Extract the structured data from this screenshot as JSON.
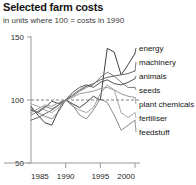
{
  "header": {
    "title": "Selected farm costs",
    "subtitle": "in units where 100 = costs in 1990"
  },
  "chart_data": {
    "type": "line",
    "title": "Selected farm costs",
    "subtitle": "in units where 100 = costs in 1990",
    "xlabel": "",
    "ylabel": "",
    "xlim": [
      1985,
      2000
    ],
    "ylim": [
      50,
      150
    ],
    "yticks": [
      50,
      100,
      150
    ],
    "ytick_labels": [
      "50",
      "100",
      "150"
    ],
    "xticks": [
      1985,
      1990,
      1995,
      2000
    ],
    "xtick_labels": [
      "1985",
      "1990",
      "1995",
      "2000"
    ],
    "grid": false,
    "reference_line": {
      "value": 100,
      "style": "dashed",
      "color": "#808080"
    },
    "legend_position": "right-inline",
    "x": [
      1985,
      1986,
      1987,
      1988,
      1989,
      1990,
      1991,
      1992,
      1993,
      1994,
      1995,
      1996,
      1997,
      1998,
      1999,
      2000
    ],
    "series": [
      {
        "name": "energy",
        "color": "#2b2b2b",
        "label_y": 48,
        "values": [
          95,
          88,
          82,
          80,
          92,
          100,
          97,
          94,
          98,
          103,
          100,
          141,
          138,
          120,
          128,
          137
        ]
      },
      {
        "name": "machinery",
        "color": "#555555",
        "label_y": 62,
        "values": [
          84,
          86,
          89,
          92,
          96,
          100,
          104,
          108,
          111,
          113,
          116,
          118,
          119,
          120,
          121,
          123
        ]
      },
      {
        "name": "animals",
        "color": "#3d3d3d",
        "label_y": 76,
        "values": [
          92,
          90,
          94,
          99,
          97,
          100,
          106,
          110,
          112,
          110,
          114,
          116,
          113,
          112,
          114,
          117
        ]
      },
      {
        "name": "seeds",
        "color": "#6b6b6b",
        "label_y": 90,
        "values": [
          88,
          91,
          95,
          93,
          96,
          100,
          103,
          107,
          110,
          112,
          118,
          122,
          119,
          114,
          110,
          110
        ]
      },
      {
        "name": "plant chemicals",
        "color": "#8c8c8c",
        "label_y": 104,
        "values": [
          90,
          93,
          96,
          95,
          98,
          100,
          102,
          105,
          106,
          107,
          109,
          110,
          108,
          105,
          103,
          102
        ]
      },
      {
        "name": "fertiliser",
        "color": "#9a9a9a",
        "label_y": 118,
        "values": [
          97,
          95,
          92,
          90,
          94,
          100,
          95,
          92,
          90,
          94,
          105,
          112,
          108,
          90,
          86,
          90
        ]
      },
      {
        "name": "feedstuff",
        "color": "#7a7a7a",
        "label_y": 132,
        "values": [
          93,
          90,
          87,
          85,
          91,
          100,
          96,
          88,
          85,
          92,
          101,
          98,
          88,
          76,
          80,
          84
        ]
      }
    ]
  }
}
